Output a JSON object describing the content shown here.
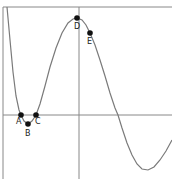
{
  "chart_data": {
    "type": "line",
    "title": "",
    "xlabel": "",
    "ylabel": "",
    "grid": false,
    "legend": null,
    "axes": {
      "x_axis_pixel_y": 115,
      "y_axis_pixel_x": 79,
      "frame_top_pixel_y": 7,
      "frame_left_pixel_x": 3
    },
    "curve_pixels": [
      [
        7,
        7
      ],
      [
        10,
        40
      ],
      [
        13,
        72
      ],
      [
        16,
        96
      ],
      [
        19,
        110
      ],
      [
        21,
        115
      ],
      [
        24,
        121
      ],
      [
        28,
        124
      ],
      [
        32,
        121
      ],
      [
        36,
        115
      ],
      [
        40,
        104
      ],
      [
        45,
        86
      ],
      [
        50,
        67
      ],
      [
        56,
        48
      ],
      [
        62,
        33
      ],
      [
        68,
        23
      ],
      [
        73,
        19
      ],
      [
        77,
        18
      ],
      [
        82,
        20
      ],
      [
        86,
        25
      ],
      [
        90,
        33
      ],
      [
        95,
        45
      ],
      [
        100,
        60
      ],
      [
        105,
        76
      ],
      [
        110,
        93
      ],
      [
        115,
        108
      ],
      [
        118,
        115
      ],
      [
        122,
        128
      ],
      [
        127,
        143
      ],
      [
        132,
        155
      ],
      [
        137,
        164
      ],
      [
        142,
        169
      ],
      [
        148,
        170
      ],
      [
        154,
        167
      ],
      [
        160,
        160
      ],
      [
        166,
        151
      ],
      [
        172,
        140
      ]
    ],
    "points": [
      {
        "label": "A",
        "px": 21,
        "py": 115,
        "label_dx": -5,
        "label_dy": 9
      },
      {
        "label": "B",
        "px": 28,
        "py": 124,
        "label_dx": -3,
        "label_dy": 12
      },
      {
        "label": "C",
        "px": 36,
        "py": 115,
        "label_dx": -1,
        "label_dy": 9
      },
      {
        "label": "D",
        "px": 77,
        "py": 18,
        "label_dx": -3,
        "label_dy": 11
      },
      {
        "label": "E",
        "px": 90,
        "py": 33,
        "label_dx": -3,
        "label_dy": 11
      }
    ],
    "colors": {
      "curve": "#7a7a7a",
      "axis": "#888888",
      "point": "#111111",
      "label": "#222222"
    }
  }
}
